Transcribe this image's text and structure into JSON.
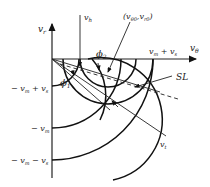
{
  "diagram": {
    "axes": {
      "vertical_label": "v",
      "vertical_sub": "r",
      "horizontal_label": "v",
      "horizontal_sub": "θ"
    },
    "labels": {
      "vh_main": "v",
      "vh_sub": "h",
      "point_open": "(v",
      "point_sub1": "θ0",
      "point_comma": ",v",
      "point_sub2": "r0",
      "point_close": ")",
      "phi1": "ϕ",
      "phi1_sub": "1",
      "phi2": "ϕ",
      "phi2_sub": "2",
      "vm_plus_vs": "v",
      "vm_plus_vs_sub1": "m",
      "vm_plus_vs_mid": " + v",
      "vm_plus_vs_sub2": "s",
      "sl": "SL",
      "vt_main": "v",
      "vt_sub": "t",
      "neg_vm_plus_vs": "− v",
      "neg_vm_plus_vs_sub1": "m",
      "neg_vm_plus_vs_mid": " + v",
      "neg_vm_plus_vs_sub2": "s",
      "neg_vm": "− v",
      "neg_vm_sub": "m",
      "neg_vm_minus_vs": "− v",
      "neg_vm_minus_vs_sub1": "m",
      "neg_vm_minus_vs_mid": " − v",
      "neg_vm_minus_vs_sub2": "s"
    }
  }
}
